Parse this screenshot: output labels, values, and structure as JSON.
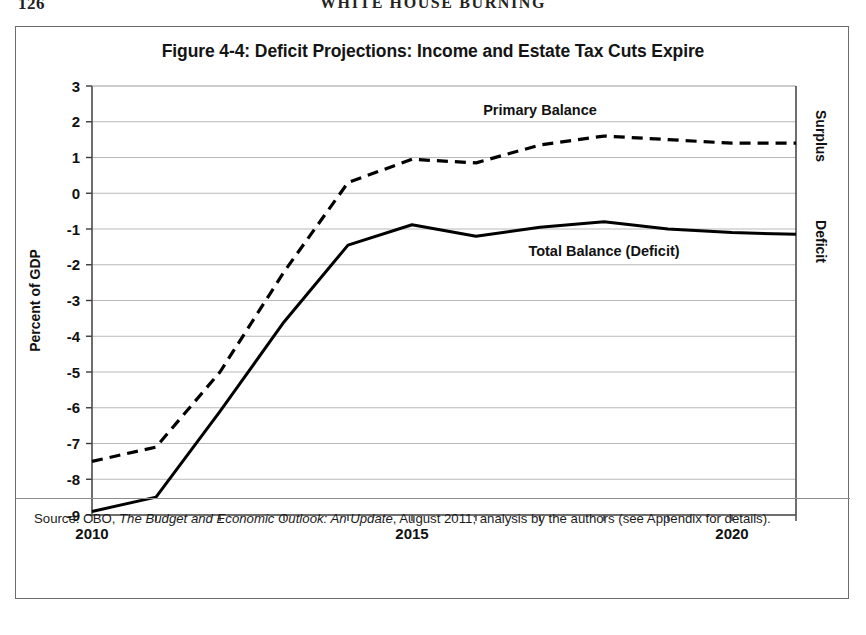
{
  "running_head": {
    "page_number": "126",
    "book_title": "WHITE HOUSE BURNING"
  },
  "figure": {
    "title": "Figure 4-4: Deficit Projections: Income and Estate Tax Cuts Expire",
    "source_prefix": "Source: CBO, ",
    "source_italic": "The Budget and Economic Outlook: An Update",
    "source_suffix": ", August 2011; analysis by the authors (see Appendix for details)."
  },
  "axis": {
    "ylabel": "Percent of GDP",
    "right_top_label": "Surplus",
    "right_bottom_label": "Deficit",
    "ytick_labels": [
      "3",
      "2",
      "1",
      "0",
      "-1",
      "-2",
      "-3",
      "-4",
      "-5",
      "-6",
      "-7",
      "-8",
      "-9"
    ],
    "xtick_labels": [
      "2010",
      "2015",
      "2020"
    ]
  },
  "series_labels": {
    "primary_balance": "Primary Balance",
    "total_balance": "Total Balance (Deficit)"
  },
  "colors": {
    "line": "#000000",
    "grid": "#b9b9b9",
    "frame": "#6c6c6c",
    "background": "#ffffff"
  },
  "chart_data": {
    "type": "line",
    "title": "Figure 4-4: Deficit Projections: Income and Estate Tax Cuts Expire",
    "xlabel": "",
    "ylabel": "Percent of GDP",
    "xlim": [
      2010,
      2021
    ],
    "ylim": [
      -9,
      3
    ],
    "ytick_values": [
      3,
      2,
      1,
      0,
      -1,
      -2,
      -3,
      -4,
      -5,
      -6,
      -7,
      -8,
      -9
    ],
    "xtick_values": [
      2010,
      2011,
      2012,
      2013,
      2014,
      2015,
      2016,
      2017,
      2018,
      2019,
      2020,
      2021
    ],
    "xtick_labeled": [
      2010,
      2015,
      2020
    ],
    "grid": "horizontal",
    "legend": "inline-annotations",
    "x": [
      2010,
      2011,
      2012,
      2013,
      2014,
      2015,
      2016,
      2017,
      2018,
      2019,
      2020,
      2021
    ],
    "series": [
      {
        "name": "Primary Balance",
        "style": "dashed",
        "label_x": 2017,
        "label_y": 2.2,
        "values": [
          -7.5,
          -7.1,
          -5.0,
          -2.2,
          0.3,
          0.95,
          0.85,
          1.35,
          1.6,
          1.5,
          1.4,
          1.4
        ]
      },
      {
        "name": "Total Balance (Deficit)",
        "style": "solid",
        "label_x": 2018,
        "label_y": -1.75,
        "values": [
          -8.9,
          -8.5,
          -6.1,
          -3.6,
          -1.45,
          -0.88,
          -1.2,
          -0.95,
          -0.8,
          -1.0,
          -1.1,
          -1.15
        ]
      }
    ],
    "annotations": [
      {
        "text": "Surplus",
        "position": "right-axis-upper",
        "rotation": 90
      },
      {
        "text": "Deficit",
        "position": "right-axis-lower",
        "rotation": 90
      }
    ]
  }
}
